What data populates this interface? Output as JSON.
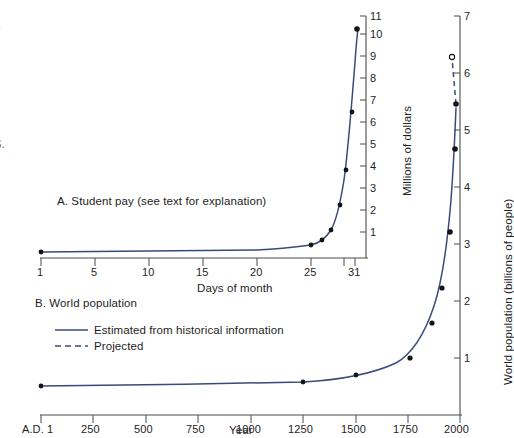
{
  "page": {
    "background": "#ffffff",
    "curve_color": "#3a4a7a",
    "axis_color": "#4a4a4a",
    "text_color": "#1e1e1e",
    "marker_color": "#141414"
  },
  "margin_text_fragments": [
    "e",
    "r",
    "-",
    "S."
  ],
  "panel_a": {
    "caption": "A. Student pay (see text for explanation)",
    "x_axis_label": "Days of month",
    "y_axis_label": "Millions of dollars",
    "x_ticks": [
      "1",
      "5",
      "10",
      "15",
      "20",
      "25",
      "31"
    ],
    "y_ticks": [
      "1",
      "2",
      "3",
      "4",
      "5",
      "6",
      "7",
      "8",
      "9",
      "10",
      "11"
    ]
  },
  "panel_b": {
    "caption": "B. World population",
    "x_axis_label": "Year",
    "y_axis_label": "World population (billions of people)",
    "x_ticks": [
      "A.D. 1",
      "250",
      "500",
      "750",
      "1000",
      "1250",
      "1500",
      "1750",
      "2000"
    ],
    "y_ticks": [
      "1",
      "2",
      "3",
      "4",
      "5",
      "6",
      "7"
    ],
    "legend": [
      {
        "style": "solid",
        "label": "Estimated from historical information"
      },
      {
        "style": "dashed",
        "label": "Projected"
      }
    ]
  },
  "chart_data": [
    {
      "type": "line",
      "id": "student-pay",
      "title": "A. Student pay (see text for explanation)",
      "xlabel": "Days of month",
      "ylabel": "Millions of dollars",
      "xlim": [
        1,
        31
      ],
      "ylim": [
        0,
        11
      ],
      "grid": false,
      "legend": "none",
      "x": [
        1,
        5,
        10,
        15,
        20,
        25,
        26,
        27,
        28,
        29,
        30,
        31
      ],
      "values": [
        5e-07,
        8e-06,
        0.00026,
        0.0082,
        0.262,
        0.335,
        0.671,
        1.342,
        2.684,
        5.369,
        10.737,
        10.7
      ],
      "markers_at_x": [
        1,
        25,
        26,
        27,
        28,
        29,
        30,
        31
      ],
      "note": "doubling-penny style exponential: pay doubles each day, reaching ~10.7 million dollars on day 31"
    },
    {
      "type": "line",
      "id": "world-population",
      "title": "B. World population",
      "xlabel": "Year",
      "ylabel": "World population (billions of people)",
      "xlim": [
        1,
        2050
      ],
      "ylim": [
        0,
        7
      ],
      "grid": false,
      "legend": "inside-upper-left",
      "series": [
        {
          "name": "Estimated from historical information",
          "style": "solid",
          "x": [
            1,
            250,
            500,
            750,
            1000,
            1250,
            1500,
            1750,
            1850,
            1900,
            1950,
            1975,
            1999
          ],
          "values": [
            0.17,
            0.19,
            0.21,
            0.22,
            0.27,
            0.4,
            0.46,
            0.79,
            1.26,
            1.65,
            2.52,
            4.07,
            6.0
          ]
        },
        {
          "name": "Projected",
          "style": "dashed",
          "x": [
            1999,
            2025
          ],
          "values": [
            6.0,
            7.3
          ]
        }
      ],
      "marker_points": [
        {
          "x": 1,
          "y": 0.17,
          "filled": true
        },
        {
          "x": 1250,
          "y": 0.4,
          "filled": true
        },
        {
          "x": 1500,
          "y": 0.46,
          "filled": true
        },
        {
          "x": 1800,
          "y": 0.98,
          "filled": true
        },
        {
          "x": 1900,
          "y": 1.65,
          "filled": true
        },
        {
          "x": 1950,
          "y": 2.52,
          "filled": true
        },
        {
          "x": 1975,
          "y": 4.07,
          "filled": true
        },
        {
          "x": 1990,
          "y": 5.3,
          "filled": true
        },
        {
          "x": 2010,
          "y": 6.2,
          "filled": false
        }
      ]
    }
  ]
}
